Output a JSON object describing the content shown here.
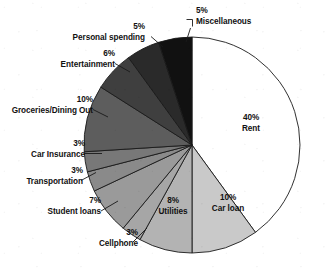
{
  "chart_data": {
    "type": "pie",
    "title": "",
    "subtitle": "",
    "xlabel": "",
    "ylabel": "",
    "legend_position": "none",
    "grid": false,
    "units": "percent",
    "start_angle_deg": 0,
    "direction": "clockwise",
    "center": {
      "x": 192,
      "y": 145
    },
    "radius": 108,
    "categories": [
      "Rent",
      "Car loan",
      "Utilities",
      "Cellphone",
      "Student loans",
      "Transportation",
      "Car Insurance",
      "Groceries/Dining Out",
      "Entertainment",
      "Personal spending",
      "Miscellaneous"
    ],
    "values": [
      40,
      10,
      8,
      3,
      7,
      3,
      3,
      10,
      6,
      5,
      5
    ],
    "colors": [
      "#ffffff",
      "#c9c9c9",
      "#b3b3b3",
      "#a6a6a6",
      "#9a9a9a",
      "#8a8a8a",
      "#787878",
      "#5d5d5d",
      "#3f3f3f",
      "#2a2a2a",
      "#111111"
    ],
    "slices": [
      {
        "label": "Rent",
        "percent_text": "40%",
        "value": 40,
        "color": "#ffffff",
        "placement": "inside"
      },
      {
        "label": "Car loan",
        "percent_text": "10%",
        "value": 10,
        "color": "#c9c9c9",
        "placement": "inside"
      },
      {
        "label": "Utilities",
        "percent_text": "8%",
        "value": 8,
        "color": "#b3b3b3",
        "placement": "inside"
      },
      {
        "label": "Cellphone",
        "percent_text": "3%",
        "value": 3,
        "color": "#a6a6a6",
        "placement": "outside"
      },
      {
        "label": "Student loans",
        "percent_text": "7%",
        "value": 7,
        "color": "#9a9a9a",
        "placement": "outside"
      },
      {
        "label": "Transportation",
        "percent_text": "3%",
        "value": 3,
        "color": "#8a8a8a",
        "placement": "outside"
      },
      {
        "label": "Car Insurance",
        "percent_text": "3%",
        "value": 3,
        "color": "#787878",
        "placement": "outside"
      },
      {
        "label": "Groceries/Dining Out",
        "percent_text": "10%",
        "value": 10,
        "color": "#5d5d5d",
        "placement": "outside"
      },
      {
        "label": "Entertainment",
        "percent_text": "6%",
        "value": 6,
        "color": "#3f3f3f",
        "placement": "outside"
      },
      {
        "label": "Personal spending",
        "percent_text": "5%",
        "value": 5,
        "color": "#2a2a2a",
        "placement": "outside"
      },
      {
        "label": "Miscellaneous",
        "percent_text": "5%",
        "value": 5,
        "color": "#111111",
        "placement": "outside"
      }
    ]
  },
  "labels": {
    "miscellaneous": {
      "pct": "5%",
      "name": "Miscellaneous"
    },
    "personal_spending": {
      "pct": "5%",
      "name": "Personal spending"
    },
    "entertainment": {
      "pct": "6%",
      "name": "Entertainment"
    },
    "groceries_dining_out": {
      "pct": "10%",
      "name": "Groceries/Dining Out"
    },
    "car_insurance": {
      "pct": "3%",
      "name": "Car Insurance"
    },
    "transportation": {
      "pct": "3%",
      "name": "Transportation"
    },
    "student_loans": {
      "pct": "7%",
      "name": "Student loans"
    },
    "cellphone": {
      "pct": "3%",
      "name": "Cellphone"
    },
    "utilities": {
      "pct": "8%",
      "name": "Utilities"
    },
    "car_loan": {
      "pct": "10%",
      "name": "Car loan"
    },
    "rent": {
      "pct": "40%",
      "name": "Rent"
    }
  },
  "style": {
    "stroke": "#1a1a1a",
    "background": "#ffffff",
    "text_color": "#111111"
  }
}
